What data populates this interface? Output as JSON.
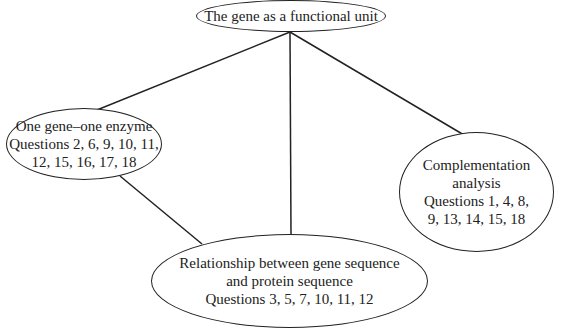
{
  "diagram": {
    "root": {
      "label": "The gene as a functional unit"
    },
    "children": [
      {
        "id": "one-gene-one-enzyme",
        "lines": [
          "One gene–one enzyme",
          "Questions 2, 6, 9, 10, 11,",
          "12, 15, 16, 17, 18"
        ]
      },
      {
        "id": "relationship",
        "lines": [
          "Relationship between gene sequence",
          "and protein sequence",
          "Questions 3, 5, 7, 10, 11, 12"
        ]
      },
      {
        "id": "complementation",
        "lines": [
          "Complementation",
          "analysis",
          "Questions 1, 4, 8,",
          "9, 13, 14, 15, 18"
        ]
      }
    ],
    "edges": [
      {
        "from": "root",
        "to": "one-gene-one-enzyme"
      },
      {
        "from": "root",
        "to": "relationship"
      },
      {
        "from": "root",
        "to": "complementation"
      },
      {
        "from": "one-gene-one-enzyme",
        "to": "relationship"
      }
    ],
    "stroke_color": "#222222"
  }
}
